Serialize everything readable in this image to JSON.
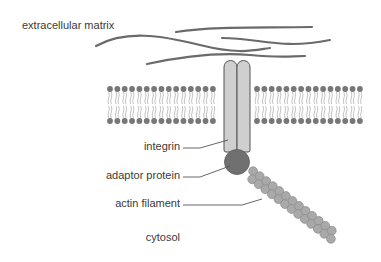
{
  "labels": {
    "extracellular_matrix": "extracellular matrix",
    "integrin": "integrin",
    "adaptor_protein": "adaptor protein",
    "actin_filament": "actin filament",
    "cytosol": "cytosol"
  },
  "colors": {
    "fibers": "#6a6a6a",
    "lipid_head": "#777777",
    "lipid_tail": "#aaaaaa",
    "integrin_fill": "#cfcfcf",
    "integrin_stroke": "#555555",
    "adaptor": "#707070",
    "actin": "#a9a9a9",
    "leader": "#555555"
  }
}
